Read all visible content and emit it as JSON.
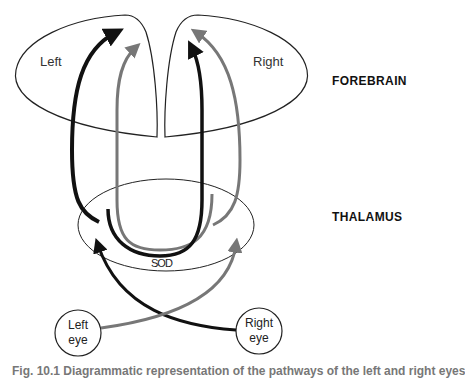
{
  "diagram": {
    "hemispheres": {
      "left": "Left",
      "right": "Right"
    },
    "regions": {
      "forebrain": "FOREBRAIN",
      "thalamus": "THALAMUS"
    },
    "structures": {
      "sod": "SOD"
    },
    "eyes": {
      "left_line1": "Left",
      "left_line2": "eye",
      "right_line1": "Right",
      "right_line2": "eye"
    },
    "pathway_colors": {
      "left_eye_pathway": "#111111",
      "right_eye_pathway": "#777777"
    },
    "caption": "Fig. 10.1  Diagrammatic representation of the pathways of the left and right eyes"
  }
}
